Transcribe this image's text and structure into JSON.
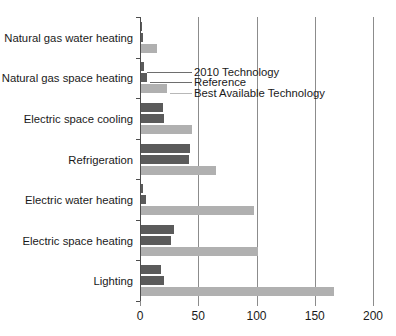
{
  "chart_data": {
    "type": "bar",
    "orientation": "horizontal",
    "title": "",
    "subtitle": "",
    "xlabel": "",
    "ylabel": "",
    "xlim": [
      0,
      200
    ],
    "ylim": null,
    "grid": true,
    "gridlines_axis": "x",
    "legend_position": "inline-callout",
    "xticks": [
      0,
      50,
      100,
      150,
      200
    ],
    "xtick_labels": [
      "0",
      "50",
      "100",
      "150",
      "200"
    ],
    "categories": [
      "Natural gas water heating",
      "Natural gas space heating",
      "Electric space cooling",
      "Refrigeration",
      "Electric water heating",
      "Electric space heating",
      "Lighting"
    ],
    "series": [
      {
        "name": "2010 Technology",
        "color": "#5b5b5b",
        "values": [
          1,
          3,
          19,
          42,
          2,
          28,
          17
        ]
      },
      {
        "name": "Reference",
        "color": "#5b5b5b",
        "values": [
          1.5,
          5,
          20,
          41,
          4,
          26,
          20
        ]
      },
      {
        "name": "Best Available Technology",
        "color": "#b0b0b0",
        "values": [
          14,
          22,
          44,
          64,
          97,
          100,
          166
        ]
      }
    ],
    "legend_entries": [
      "2010 Technology",
      "Reference",
      "Best Available Technology"
    ]
  }
}
